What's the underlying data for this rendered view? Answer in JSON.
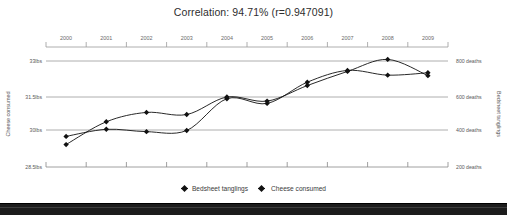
{
  "chart_data": {
    "type": "line",
    "title": "Correlation: 94.71% (r=0.947091)",
    "correlation_percent": "94.71%",
    "r_value": "r=0.947091",
    "x": [
      2000,
      2001,
      2002,
      2003,
      2004,
      2005,
      2006,
      2007,
      2008,
      2009
    ],
    "xlabel": "",
    "xtick_labels": [
      "2000",
      "2001",
      "2002",
      "2003",
      "2004",
      "2005",
      "2006",
      "2007",
      "2008",
      "2009"
    ],
    "grid": true,
    "legend_position": "bottom-center",
    "series": [
      {
        "name": "Cheese consumed",
        "axis": "left",
        "unit": "lbs",
        "ylabel": "Cheese consumed",
        "ytick_labels": [
          "33lbs",
          "31.5lbs",
          "30lbs",
          "28.5lbs"
        ],
        "ytick_values": [
          33,
          31.5,
          30,
          28.5
        ],
        "ylim": [
          28.5,
          33
        ],
        "values": [
          29.8,
          30.1,
          30.0,
          30.05,
          31.4,
          31.2,
          32.1,
          32.6,
          32.4,
          32.5
        ],
        "marker": "diamond",
        "color": "#111111"
      },
      {
        "name": "Bedsheet tanglings",
        "axis": "right",
        "unit": "deaths",
        "ylabel": "Bedsheet tanglings",
        "ytick_labels": [
          "800 deaths",
          "600 deaths",
          "400 deaths",
          "200 deaths"
        ],
        "ytick_values": [
          800,
          600,
          400,
          200
        ],
        "ylim": [
          200,
          800
        ],
        "values": [
          327,
          456,
          509,
          497,
          596,
          573,
          661,
          741,
          809,
          717
        ],
        "marker": "diamond",
        "color": "#111111"
      }
    ]
  },
  "legend": {
    "items": [
      {
        "label": "Bedsheet tanglings"
      },
      {
        "label": "Cheese consumed"
      }
    ]
  },
  "axes": {
    "left_title": "Cheese consumed",
    "right_title": "Bedsheet tanglings"
  }
}
